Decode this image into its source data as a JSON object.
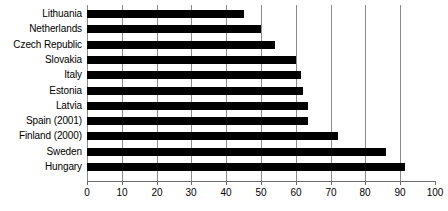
{
  "chart_data": {
    "type": "bar",
    "orientation": "horizontal",
    "title": "",
    "subtitle": "",
    "xlabel": "",
    "ylabel": "",
    "xlim": [
      0,
      100
    ],
    "ylim": null,
    "grid": true,
    "grid_axis": "x",
    "legend": false,
    "legend_position": "none",
    "categories": [
      "Lithuania",
      "Netherlands",
      "Czech Republic",
      "Slovakia",
      "Italy",
      "Estonia",
      "Latvia",
      "Spain (2001)",
      "Finland (2000)",
      "Sweden",
      "Hungary"
    ],
    "values": [
      45,
      50,
      54,
      60,
      61.5,
      62,
      63.5,
      63.5,
      72,
      86,
      91.5
    ],
    "xticks": [
      0,
      10,
      20,
      30,
      40,
      50,
      60,
      70,
      80,
      90,
      100
    ],
    "xtick_labels": [
      "0",
      "10",
      "20",
      "30",
      "40",
      "50",
      "60",
      "70",
      "80",
      "90",
      "100"
    ],
    "bar_color": "#000000",
    "grid_color": "#8a8a8a",
    "axis_color": "#6b6b6b",
    "background_color": "#ffffff"
  }
}
